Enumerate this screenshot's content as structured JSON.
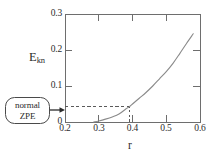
{
  "figure": {
    "name": "kinetic-energy-vs-r-plot",
    "background": "#ffffff",
    "frame_color": "#6e6e6e",
    "curve_color": "#8a8a8a",
    "dash_color": "#5a5a5a",
    "text_color": "#2b2b2b"
  },
  "axis_titles": {
    "y_main": "E",
    "y_sub": "kn",
    "x": "r"
  },
  "callout": {
    "line1": "normal",
    "line2": "ZPE",
    "arrow": "arrow-right-icon"
  },
  "chart_data": {
    "type": "line",
    "title": "",
    "xlabel": "r",
    "ylabel": "E_kn",
    "xlim": [
      0.2,
      0.6
    ],
    "ylim": [
      0.0,
      0.3
    ],
    "xticks": [
      0.2,
      0.3,
      0.4,
      0.5,
      0.6
    ],
    "xtick_labels": [
      "0.2",
      "0.3",
      "0.4",
      "0.5",
      "0.6"
    ],
    "yticks": [
      0.0,
      0.1,
      0.2,
      0.3
    ],
    "ytick_labels": [
      "0",
      "0.1",
      "0.2",
      "0.3"
    ],
    "grid": false,
    "legend": false,
    "tick_direction": "in",
    "series": [
      {
        "name": "E_kn(r)",
        "color": "#8a8a8a",
        "x": [
          0.285,
          0.3,
          0.32,
          0.34,
          0.36,
          0.38,
          0.39,
          0.4,
          0.42,
          0.44,
          0.46,
          0.48,
          0.5,
          0.52,
          0.54,
          0.56,
          0.58
        ],
        "y": [
          0.0,
          0.003,
          0.008,
          0.014,
          0.022,
          0.036,
          0.042,
          0.05,
          0.066,
          0.082,
          0.1,
          0.12,
          0.14,
          0.163,
          0.19,
          0.218,
          0.245
        ]
      }
    ],
    "annotations": [
      {
        "name": "normal-zpe-level",
        "type": "hline",
        "y": 0.042,
        "x_from": 0.2,
        "x_to": 0.39,
        "style": "dashed",
        "label": "normal ZPE"
      },
      {
        "name": "crossing-point-drop",
        "type": "vline",
        "x": 0.39,
        "y_from": 0.0,
        "y_to": 0.042,
        "style": "dashed"
      }
    ]
  }
}
